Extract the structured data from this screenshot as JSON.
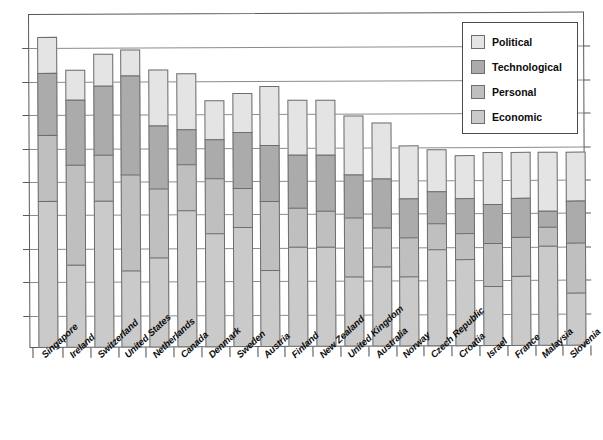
{
  "chart": {
    "type": "bar",
    "title": "",
    "xlabel": "",
    "ylabel": "",
    "caption": ""
  },
  "legend": {
    "position": "top-right",
    "items": [
      {
        "label": "Political",
        "color": "#e4e4e4",
        "key": "political"
      },
      {
        "label": "Technological",
        "color": "#ababab",
        "key": "technological"
      },
      {
        "label": "Personal",
        "color": "#bfbfbf",
        "key": "personal"
      },
      {
        "label": "Economic",
        "color": "#cacaca",
        "key": "economic"
      }
    ]
  },
  "axes": {
    "y_gridline_count": 9,
    "y_grid_spacing_px": 33.4,
    "grid": true,
    "y_tick_labels": []
  },
  "chart_data": {
    "type": "bar",
    "stacked": true,
    "title": "",
    "xlabel": "",
    "ylabel": "",
    "grid": true,
    "legend_position": "top-right",
    "ylim": [
      0,
      100
    ],
    "categories": [
      "Singapore",
      "Ireland",
      "Switzerland",
      "United States",
      "Netherlands",
      "Canada",
      "Denmark",
      "Sweden",
      "Austria",
      "Finland",
      "New Zealand",
      "United Kingdom",
      "Australia",
      "Norway",
      "Czech Republic",
      "Croatia",
      "Israel",
      "France",
      "Malaysia",
      "Slovenia"
    ],
    "series": [
      {
        "name": "Economic",
        "color": "#cacaca",
        "values": [
          44,
          25,
          44,
          23,
          27,
          41,
          34,
          36,
          23,
          30,
          30,
          21,
          24,
          21,
          29,
          26,
          18,
          21,
          30,
          16
        ]
      },
      {
        "name": "Personal",
        "color": "#bfbfbf",
        "values": [
          20,
          30,
          14,
          29,
          21,
          14,
          17,
          12,
          21,
          12,
          11,
          18,
          12,
          12,
          8,
          8,
          13,
          12,
          6,
          15
        ]
      },
      {
        "name": "Technological",
        "color": "#ababab",
        "values": [
          19,
          20,
          21,
          30,
          19,
          11,
          12,
          17,
          17,
          16,
          17,
          13,
          15,
          12,
          10,
          11,
          12,
          12,
          5,
          13
        ]
      },
      {
        "name": "Political",
        "color": "#e4e4e4",
        "values": [
          11,
          9,
          10,
          8,
          17,
          17,
          12,
          12,
          18,
          17,
          17,
          18,
          17,
          16,
          13,
          13,
          16,
          14,
          18,
          15
        ]
      }
    ],
    "totals": [
      94,
      84,
      89,
      90,
      84,
      83,
      75,
      77,
      79,
      75,
      75,
      70,
      68,
      61,
      60,
      58,
      59,
      59,
      59,
      59
    ]
  }
}
